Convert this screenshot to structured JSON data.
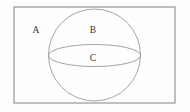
{
  "diagram": {
    "kind": "set-diagram",
    "background_color": "#fefefe",
    "canvas": {
      "width": 190,
      "height": 112
    },
    "rectangle": {
      "name": "outer-rectangle",
      "x": 14,
      "y": 7,
      "width": 161,
      "height": 96,
      "stroke_color": "#8a8a8a",
      "stroke_width": 1.1,
      "fill_color": "#fefefe"
    },
    "circle": {
      "name": "inner-circle",
      "cx": 94.5,
      "cy": 55,
      "r": 46,
      "stroke_color": "#9a9a9a",
      "stroke_width": 0.9,
      "fill_color": "none"
    },
    "ellipse": {
      "name": "equator-ellipse",
      "cx": 94.5,
      "cy": 55.5,
      "rx": 46,
      "ry": 11,
      "stroke_color": "#9a9a9a",
      "stroke_width": 0.9,
      "fill_color": "none"
    },
    "labels": [
      {
        "id": "label-a",
        "text": "A",
        "x": 36,
        "y": 30.5,
        "region": "inside rectangle, outside circle"
      },
      {
        "id": "label-b",
        "text": "B",
        "x": 93,
        "y": 30.5,
        "region": "inside circle, above ellipse"
      },
      {
        "id": "label-c",
        "text": "C",
        "x": 93,
        "y": 59,
        "region": "inside ellipse"
      }
    ]
  }
}
